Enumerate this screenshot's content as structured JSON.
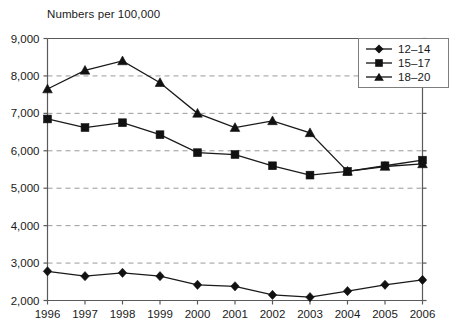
{
  "chart_data": {
    "type": "line",
    "title": "Numbers per 100,000",
    "xlabel": "",
    "ylabel": "",
    "grid": true,
    "legend_position": "top-right",
    "x": [
      1996,
      1997,
      1998,
      1999,
      2000,
      2001,
      2002,
      2003,
      2004,
      2005,
      2006
    ],
    "categories": [
      "1996",
      "1997",
      "1998",
      "1999",
      "2000",
      "2001",
      "2002",
      "2003",
      "2004",
      "2005",
      "2006"
    ],
    "ylim": [
      2000,
      9000
    ],
    "yticks": [
      2000,
      3000,
      4000,
      5000,
      6000,
      7000,
      8000,
      9000
    ],
    "ytick_labels": [
      "2,000",
      "3,000",
      "4,000",
      "5,000",
      "6,000",
      "7,000",
      "8,000",
      "9,000"
    ],
    "series": [
      {
        "name": "12-14",
        "marker": "diamond",
        "color": "#111111",
        "values": [
          2780,
          2650,
          2740,
          2650,
          2420,
          2380,
          2150,
          2090,
          2250,
          2420,
          2550
        ]
      },
      {
        "name": "15-17",
        "marker": "square",
        "color": "#111111",
        "values": [
          6850,
          6620,
          6750,
          6430,
          5950,
          5900,
          5600,
          5350,
          5450,
          5600,
          5750
        ]
      },
      {
        "name": "18-20",
        "marker": "triangle",
        "color": "#111111",
        "values": [
          7650,
          8150,
          8400,
          7820,
          7000,
          6620,
          6800,
          6480,
          5450,
          5580,
          5650
        ]
      }
    ]
  },
  "legend": {
    "items": [
      {
        "label": "12–14",
        "marker": "diamond"
      },
      {
        "label": "15–17",
        "marker": "square"
      },
      {
        "label": "18–20",
        "marker": "triangle"
      }
    ]
  }
}
